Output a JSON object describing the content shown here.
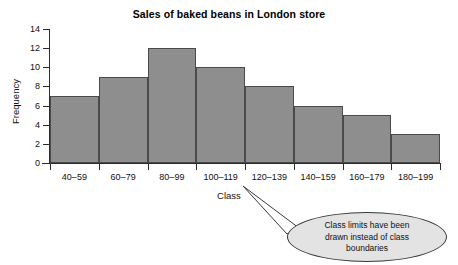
{
  "chart_data": {
    "type": "bar",
    "title": "Sales of baked beans in London store",
    "xlabel": "Class",
    "ylabel": "Frequency",
    "categories": [
      "40–59",
      "60–79",
      "80–99",
      "100–119",
      "120–139",
      "140–159",
      "160–179",
      "180–199"
    ],
    "values": [
      7,
      9,
      12,
      10,
      8,
      6,
      5,
      3
    ],
    "ylim": [
      0,
      14
    ],
    "ytick_labels": [
      "0",
      "2",
      "4",
      "6",
      "8",
      "10",
      "12",
      "14"
    ],
    "ytick_values": [
      0,
      2,
      4,
      6,
      8,
      10,
      12,
      14
    ],
    "grid": false,
    "legend": false,
    "bar_fill_color": "#8e8e8e",
    "bar_edge_color": "#4a4a4a",
    "axis_color": "#2b2b2b",
    "annotations": [
      {
        "name": "class-limits-callout",
        "text": "Class limits have been drawn instead of class boundaries",
        "lines": [
          "Class limits have been",
          "drawn instead of class",
          "boundaries"
        ],
        "shape": "ellipse",
        "fill_color": "#e3e3e3",
        "border_color": "#3a3a3a",
        "points_at": "120–139"
      }
    ]
  }
}
